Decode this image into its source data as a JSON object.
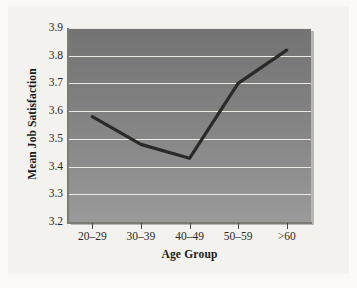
{
  "chart_data": {
    "type": "line",
    "title": "",
    "xlabel": "Age Group",
    "ylabel": "Mean Job Satisfaction",
    "categories": [
      "20–29",
      "30–39",
      "40–49",
      "50–59",
      ">60"
    ],
    "values": [
      3.58,
      3.48,
      3.43,
      3.7,
      3.82
    ],
    "series": [
      {
        "name": "Mean Job Satisfaction",
        "values": [
          3.58,
          3.48,
          3.43,
          3.7,
          3.82
        ]
      }
    ],
    "ylim": [
      3.2,
      3.9
    ],
    "ytick_labels": [
      "3.9",
      "3.8",
      "3.7",
      "3.6",
      "3.5",
      "3.4",
      "3.3",
      "3.2"
    ],
    "ytick_values": [
      3.9,
      3.8,
      3.7,
      3.6,
      3.5,
      3.4,
      3.3,
      3.2
    ],
    "ytick_step": 0.1,
    "grid": true,
    "grid_orientation": "horizontal",
    "legend": false,
    "legend_position": "none",
    "colors": {
      "line": "#2b2a28",
      "gridline": "#ece9e3",
      "plot_background_top": "#737373",
      "plot_background_bottom": "#9a9a9a",
      "page_background": "#f4f2ee",
      "axis": "#7d7b76",
      "text": "#1b1a18"
    }
  }
}
